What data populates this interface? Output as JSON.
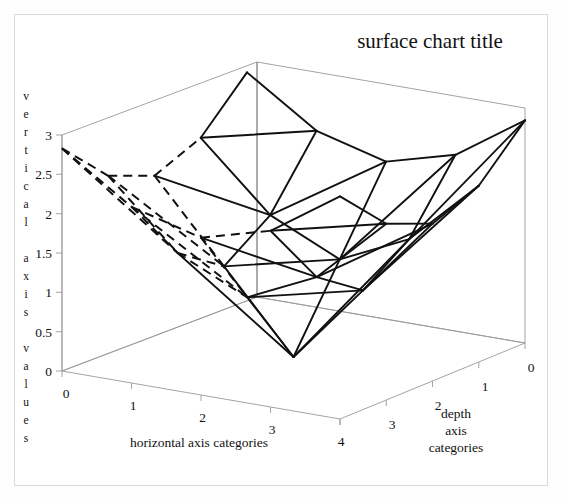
{
  "chart_data": {
    "type": "surface",
    "title": "surface chart title",
    "xlabel": "horizontal axis categories",
    "zlabel": "depth axis categories",
    "ylabel": "vertical axis values",
    "x_ticks": [
      "0",
      "1",
      "2",
      "3",
      "4"
    ],
    "depth_ticks": [
      "0",
      "1",
      "2",
      "3",
      "4"
    ],
    "y_ticks": [
      "3",
      "2.5",
      "2",
      "1.5",
      "1",
      "0.5",
      "0"
    ],
    "ylim": [
      0,
      3
    ],
    "xlim": [
      0,
      4
    ],
    "zlim": [
      0,
      4
    ],
    "grid": false,
    "legend": "none",
    "categories": [
      "0",
      "1",
      "2",
      "3",
      "4"
    ],
    "series": [
      {
        "name": "depth 0",
        "values": [
          2.83,
          2.24,
          2.0,
          2.24,
          2.83
        ]
      },
      {
        "name": "depth 1",
        "values": [
          2.24,
          1.41,
          1.0,
          1.41,
          2.24
        ]
      },
      {
        "name": "depth 2",
        "values": [
          2.0,
          1.0,
          0.0,
          1.0,
          2.0
        ]
      },
      {
        "name": "depth 3",
        "values": [
          2.24,
          1.41,
          1.0,
          1.41,
          2.24
        ]
      },
      {
        "name": "depth 4",
        "values": [
          2.83,
          2.24,
          2.0,
          2.24,
          2.83
        ]
      }
    ],
    "line_styles": {
      "visible_front": "solid",
      "hidden_back": "dashed"
    },
    "colors": {
      "mesh": "#111111",
      "axis": "#9a9a9a",
      "background": "#ffffff",
      "text": "#111111"
    }
  },
  "vertical_axis_letters": [
    "v",
    "e",
    "r",
    "t",
    "i",
    "c",
    "a",
    "l",
    "",
    "a",
    "x",
    "i",
    "s",
    "",
    "v",
    "a",
    "l",
    "u",
    "e",
    "s"
  ],
  "depth_label_lines": [
    "depth",
    "axis",
    "categories"
  ]
}
